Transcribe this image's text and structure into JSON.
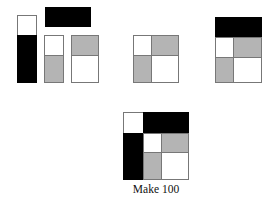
{
  "caption": "Make 100",
  "colors": {
    "black": "#000000",
    "gray": "#b4b4b4",
    "white": "#ffffff",
    "outline": "#777777"
  },
  "figures": [
    {
      "name": "pieces",
      "description": "separate pieces: tall white/black bar, black horizontal bar, white/gray bar, gray/white bar"
    },
    {
      "name": "square-2x2",
      "description": "2x2 square: white, gray / gray, white"
    },
    {
      "name": "square-with-top-bar",
      "description": "black bar on top of the 2x2 square"
    },
    {
      "name": "assembled-square",
      "description": "complete square: white corner, black top bar, black left bar, inner 2x2 square"
    }
  ]
}
